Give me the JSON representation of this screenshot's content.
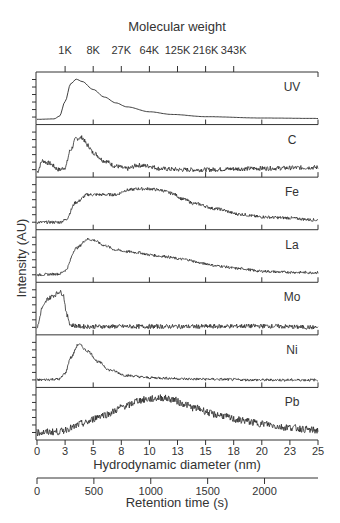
{
  "chart_data": {
    "type": "line",
    "layout": "stacked-panels",
    "title": "",
    "top_axis": {
      "label": "Molecular weight",
      "ticks": [
        "1K",
        "8K",
        "27K",
        "64K",
        "125K",
        "216K",
        "343K"
      ],
      "tick_positions_nm": [
        2.5,
        5.0,
        7.5,
        10.0,
        12.5,
        15.0,
        17.5
      ]
    },
    "xlabel": "Hydrodynamic diameter (nm)",
    "x_ticks": [
      "0",
      "3",
      "5",
      "8",
      "10",
      "13",
      "15",
      "18",
      "20",
      "23",
      "25"
    ],
    "xlim": [
      0,
      25
    ],
    "secondary_x_axis": {
      "label": "Retention time (s)",
      "ticks": [
        "0",
        "500",
        "1000",
        "1500",
        "2000"
      ],
      "xlim_s": [
        0,
        2470
      ]
    },
    "ylabel": "Intensity (AU)",
    "grid": false,
    "legend": "none (panel labels at right)",
    "series": [
      {
        "name": "UV",
        "noise": 0.0,
        "points": [
          [
            0,
            0.05
          ],
          [
            1.5,
            0.06
          ],
          [
            2.0,
            0.12
          ],
          [
            2.5,
            0.45
          ],
          [
            3.0,
            0.85
          ],
          [
            3.5,
            0.95
          ],
          [
            4.0,
            0.9
          ],
          [
            5,
            0.72
          ],
          [
            6,
            0.55
          ],
          [
            7,
            0.42
          ],
          [
            8,
            0.33
          ],
          [
            10,
            0.22
          ],
          [
            12,
            0.16
          ],
          [
            15,
            0.11
          ],
          [
            20,
            0.08
          ],
          [
            25,
            0.07
          ]
        ]
      },
      {
        "name": "C",
        "noise": 0.05,
        "points": [
          [
            0,
            0.05
          ],
          [
            0.5,
            0.3
          ],
          [
            1,
            0.25
          ],
          [
            2,
            0.1
          ],
          [
            2.5,
            0.15
          ],
          [
            3,
            0.55
          ],
          [
            3.5,
            0.8
          ],
          [
            4,
            0.82
          ],
          [
            4.5,
            0.65
          ],
          [
            5,
            0.48
          ],
          [
            6,
            0.3
          ],
          [
            7,
            0.18
          ],
          [
            8,
            0.12
          ],
          [
            9,
            0.2
          ],
          [
            10,
            0.18
          ],
          [
            11,
            0.12
          ],
          [
            13,
            0.1
          ],
          [
            15,
            0.1
          ],
          [
            18,
            0.12
          ],
          [
            20,
            0.13
          ],
          [
            25,
            0.15
          ]
        ]
      },
      {
        "name": "Fe",
        "noise": 0.035,
        "points": [
          [
            0,
            0.1
          ],
          [
            2,
            0.1
          ],
          [
            2.5,
            0.15
          ],
          [
            3.5,
            0.55
          ],
          [
            4.5,
            0.72
          ],
          [
            6,
            0.72
          ],
          [
            7,
            0.72
          ],
          [
            8,
            0.82
          ],
          [
            9,
            0.85
          ],
          [
            10,
            0.85
          ],
          [
            11,
            0.82
          ],
          [
            12,
            0.75
          ],
          [
            13,
            0.62
          ],
          [
            14,
            0.52
          ],
          [
            16,
            0.4
          ],
          [
            18,
            0.28
          ],
          [
            20,
            0.22
          ],
          [
            22,
            0.2
          ],
          [
            25,
            0.15
          ]
        ]
      },
      {
        "name": "La",
        "noise": 0.03,
        "points": [
          [
            0,
            0.1
          ],
          [
            2,
            0.12
          ],
          [
            2.5,
            0.2
          ],
          [
            3.5,
            0.7
          ],
          [
            4.5,
            0.9
          ],
          [
            5,
            0.88
          ],
          [
            6,
            0.76
          ],
          [
            7,
            0.66
          ],
          [
            8,
            0.62
          ],
          [
            9,
            0.6
          ],
          [
            10,
            0.55
          ],
          [
            11,
            0.52
          ],
          [
            13,
            0.45
          ],
          [
            15,
            0.35
          ],
          [
            16,
            0.3
          ],
          [
            18,
            0.24
          ],
          [
            20,
            0.18
          ],
          [
            22,
            0.16
          ],
          [
            25,
            0.15
          ]
        ]
      },
      {
        "name": "Mo",
        "noise": 0.05,
        "points": [
          [
            0,
            0.1
          ],
          [
            0.5,
            0.55
          ],
          [
            1,
            0.75
          ],
          [
            1.5,
            0.82
          ],
          [
            2,
            0.9
          ],
          [
            2.3,
            0.85
          ],
          [
            2.7,
            0.35
          ],
          [
            3,
            0.15
          ],
          [
            4,
            0.12
          ],
          [
            8,
            0.12
          ],
          [
            14,
            0.12
          ],
          [
            20,
            0.13
          ],
          [
            25,
            0.1
          ]
        ]
      },
      {
        "name": "Ni",
        "noise": 0.03,
        "points": [
          [
            0,
            0.1
          ],
          [
            2,
            0.12
          ],
          [
            2.5,
            0.25
          ],
          [
            3,
            0.6
          ],
          [
            3.7,
            0.9
          ],
          [
            4.5,
            0.75
          ],
          [
            5.5,
            0.5
          ],
          [
            6.5,
            0.32
          ],
          [
            8,
            0.2
          ],
          [
            10,
            0.15
          ],
          [
            14,
            0.12
          ],
          [
            20,
            0.1
          ],
          [
            25,
            0.1
          ]
        ]
      },
      {
        "name": "Pb",
        "noise": 0.08,
        "points": [
          [
            0,
            0.1
          ],
          [
            2,
            0.12
          ],
          [
            3,
            0.2
          ],
          [
            4,
            0.3
          ],
          [
            6,
            0.5
          ],
          [
            8,
            0.7
          ],
          [
            9,
            0.82
          ],
          [
            10,
            0.85
          ],
          [
            11,
            0.88
          ],
          [
            12,
            0.85
          ],
          [
            13,
            0.75
          ],
          [
            14,
            0.65
          ],
          [
            16,
            0.5
          ],
          [
            18,
            0.38
          ],
          [
            20,
            0.3
          ],
          [
            22,
            0.22
          ],
          [
            25,
            0.15
          ]
        ]
      }
    ]
  },
  "colors": {
    "line": "#2a2a2a",
    "axis": "#333333",
    "background": "#ffffff"
  }
}
